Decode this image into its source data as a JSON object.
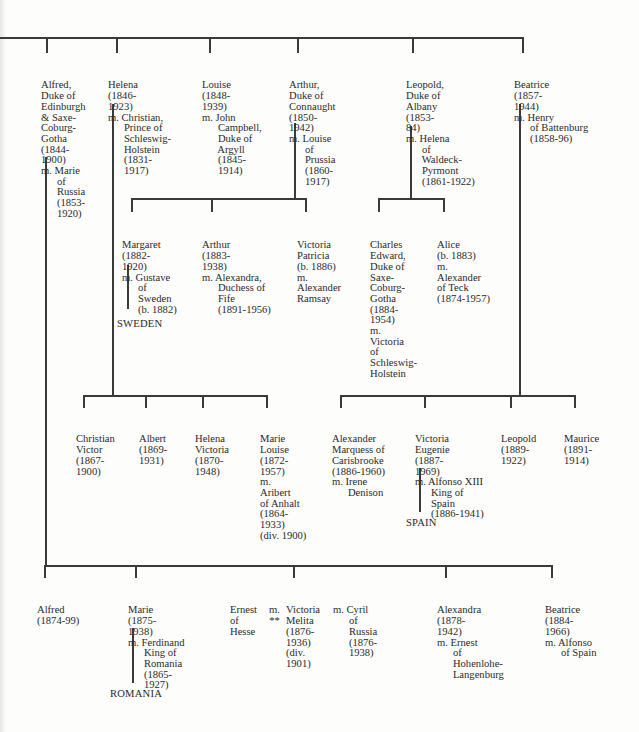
{
  "tree": {
    "generation1": [
      {
        "id": "alfred",
        "lines": [
          "Alfred,",
          "Duke of",
          "Edinburgh",
          "& Saxe-",
          "Coburg-",
          "Gotha",
          "(1844-",
          "1900)",
          "m. Marie",
          "      of",
          "      Russia",
          "      (1853-",
          "      1920)"
        ]
      },
      {
        "id": "helena",
        "lines": [
          "Helena",
          "(1846-",
          "1923)",
          "m. Christian,",
          "      Prince of",
          "      Schleswig-",
          "      Holstein",
          "      (1831-",
          "      1917)"
        ]
      },
      {
        "id": "louise",
        "lines": [
          "Louise",
          "(1848-",
          "1939)",
          "m. John",
          "      Campbell,",
          "      Duke of",
          "      Argyll",
          "      (1845-",
          "      1914)"
        ]
      },
      {
        "id": "arthur",
        "lines": [
          "Arthur,",
          "Duke of",
          "Connaught",
          "(1850-",
          "1942)",
          "m. Louise",
          "      of",
          "      Prussia",
          "      (1860-",
          "      1917)"
        ]
      },
      {
        "id": "leopold",
        "lines": [
          "Leopold,",
          "Duke of",
          "Albany",
          "(1853-",
          "84)",
          "m. Helena",
          "      of",
          "      Waldeck-",
          "      Pyrmont",
          "      (1861-1922)"
        ]
      },
      {
        "id": "beatrice",
        "lines": [
          "Beatrice",
          "(1857-",
          "1944)",
          "m. Henry",
          "      of Battenburg",
          "      (1858-96)"
        ]
      }
    ],
    "connaught_children": [
      {
        "id": "margaret",
        "lines": [
          "Margaret",
          "(1882-",
          "1920)",
          "m. Gustave",
          "      of",
          "      Sweden",
          "      (b. 1882)"
        ]
      },
      {
        "id": "arthur-jr",
        "lines": [
          "Arthur",
          "(1883-",
          "1938)",
          "m. Alexandra,",
          "      Duchess of",
          "      Fife",
          "      (1891-1956)"
        ]
      },
      {
        "id": "victoria-patricia",
        "lines": [
          "Victoria",
          "Patricia",
          "(b. 1886)",
          "m.",
          "Alexander",
          "Ramsay"
        ]
      }
    ],
    "albany_children": [
      {
        "id": "charles-edward",
        "lines": [
          "Charles",
          "Edward,",
          "Duke of",
          "Saxe-",
          "Coburg-",
          "Gotha",
          "(1884-",
          "1954)",
          "m.",
          "Victoria",
          "of",
          "Schleswig-",
          "Holstein"
        ]
      },
      {
        "id": "alice",
        "lines": [
          "Alice",
          "(b. 1883)",
          "m.",
          "Alexander",
          "of Teck",
          "(1874-1957)"
        ]
      }
    ],
    "helena_children": [
      {
        "id": "christian-victor",
        "lines": [
          "Christian",
          "Victor",
          "(1867-",
          "1900)"
        ]
      },
      {
        "id": "albert",
        "lines": [
          "Albert",
          "(1869-",
          "1931)"
        ]
      },
      {
        "id": "helena-victoria",
        "lines": [
          "Helena",
          "Victoria",
          "(1870-",
          "1948)"
        ]
      },
      {
        "id": "marie-louise",
        "lines": [
          "Marie",
          "Louise",
          "(1872-",
          "1957)",
          "m.",
          "Aribert",
          "of Anhalt",
          "(1864-",
          "1933)",
          "(div. 1900)"
        ]
      }
    ],
    "beatrice_children": [
      {
        "id": "alexander",
        "lines": [
          "Alexander",
          "Marquess of",
          "Carisbrooke",
          "(1886-1960)",
          "m. Irene",
          "      Denison"
        ]
      },
      {
        "id": "victoria-eugenie",
        "lines": [
          "Victoria",
          "Eugenie",
          "(1887-",
          "1969)",
          "m. Alfonso XIII",
          "      King of",
          "      Spain",
          "      (1886-1941)"
        ]
      },
      {
        "id": "leopold-jr",
        "lines": [
          "Leopold",
          "(1889-",
          "1922)"
        ]
      },
      {
        "id": "maurice",
        "lines": [
          "Maurice",
          "(1891-",
          "1914)"
        ]
      }
    ],
    "alfred_children": [
      {
        "id": "alfred-jr",
        "lines": [
          "Alfred",
          "(1874-99)"
        ]
      },
      {
        "id": "marie",
        "lines": [
          "Marie",
          "(1875-",
          "1938)",
          "m. Ferdinand",
          "      King of",
          "      Romania",
          "      (1865-",
          "      1927)"
        ]
      },
      {
        "id": "ernest",
        "lines": [
          "Ernest",
          "of",
          "Hesse"
        ]
      },
      {
        "id": "victoria-melita-m",
        "lines": [
          "m.",
          "**"
        ]
      },
      {
        "id": "victoria-melita",
        "lines": [
          "Victoria",
          "Melita",
          "(1876-",
          "1936)",
          "(div.",
          "1901)"
        ]
      },
      {
        "id": "cyril",
        "lines": [
          "m. Cyril",
          "      of",
          "      Russia",
          "      (1876-",
          "      1938)"
        ]
      },
      {
        "id": "alexandra",
        "lines": [
          "Alexandra",
          "(1878-",
          "1942)",
          "m. Ernest",
          "      of",
          "      Hohenlohe-",
          "      Langenburg"
        ]
      },
      {
        "id": "beatrice-jr",
        "lines": [
          "Beatrice",
          "(1884-",
          "1966)",
          "m. Alfonso",
          "      of Spain"
        ]
      }
    ],
    "country_labels": {
      "sweden": "SWEDEN",
      "spain": "SPAIN",
      "romania": "ROMANIA"
    }
  },
  "colors": {
    "line": "#3a3a3a",
    "text": "#2a2a2a",
    "background": "#fdfdfc"
  }
}
